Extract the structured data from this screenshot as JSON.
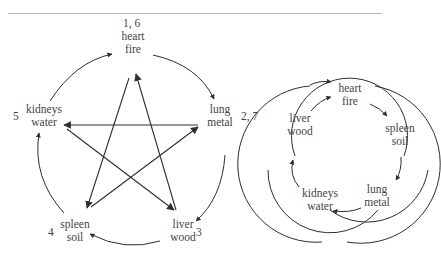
{
  "left_diagram": {
    "title": "Generating and controlling cycles (pentagram)",
    "nodes": [
      {
        "id": "heart",
        "organ": "heart",
        "element": "fire",
        "order": "1, 6"
      },
      {
        "id": "lung",
        "organ": "lung",
        "element": "metal",
        "order": "2, 7"
      },
      {
        "id": "liver",
        "organ": "liver",
        "element": "wood",
        "order": "3"
      },
      {
        "id": "spleen",
        "organ": "spleen",
        "element": "soil",
        "order": "4"
      },
      {
        "id": "kidneys",
        "organ": "kidneys",
        "element": "water",
        "order": "5"
      }
    ],
    "outer_arrows": [
      [
        "kidneys",
        "heart"
      ],
      [
        "heart",
        "lung"
      ],
      [
        "lung",
        "liver"
      ],
      [
        "liver",
        "spleen"
      ],
      [
        "spleen",
        "kidneys"
      ]
    ],
    "star_arrows": [
      [
        "heart",
        "spleen"
      ],
      [
        "liver",
        "heart"
      ],
      [
        "lung",
        "kidneys"
      ],
      [
        "kidneys",
        "liver"
      ],
      [
        "spleen",
        "lung"
      ]
    ]
  },
  "right_diagram": {
    "title": "Interlocking cycles",
    "nodes": [
      {
        "id": "heart",
        "organ": "heart",
        "element": "fire"
      },
      {
        "id": "spleen",
        "organ": "spleen",
        "element": "soil"
      },
      {
        "id": "lung",
        "organ": "lung",
        "element": "metal"
      },
      {
        "id": "kidneys",
        "organ": "kidneys",
        "element": "water"
      },
      {
        "id": "liver",
        "organ": "liver",
        "element": "wood"
      }
    ],
    "arrows": [
      [
        "liver",
        "heart"
      ],
      [
        "heart",
        "spleen"
      ],
      [
        "spleen",
        "lung"
      ],
      [
        "lung",
        "kidneys"
      ],
      [
        "kidneys",
        "liver"
      ]
    ],
    "circles": 3
  },
  "colors": {
    "line": "#2e2e2e",
    "text": "#444444",
    "rule": "#b8b8b8"
  }
}
